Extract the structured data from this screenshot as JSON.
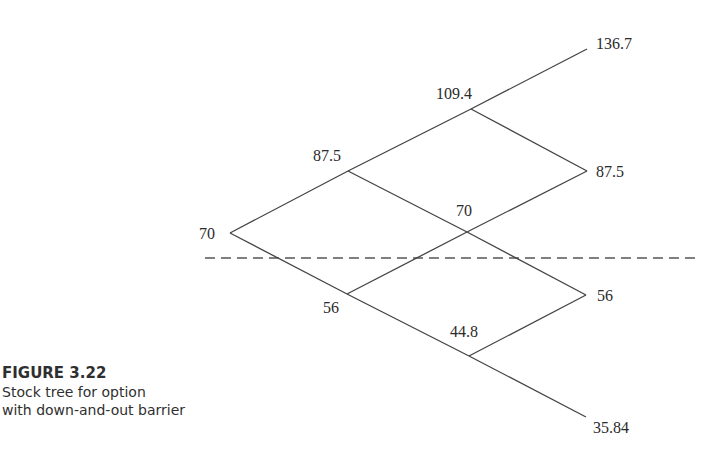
{
  "figure": {
    "title": "FIGURE 3.22",
    "caption_lines": [
      "Stock tree for option",
      "with down-and-out barrier"
    ]
  },
  "tree": {
    "line_color": "#444444",
    "barrier": {
      "y": 258,
      "x1": 205,
      "x2": 698,
      "style": "dashed"
    },
    "nodes": [
      {
        "id": "n0",
        "value": "70",
        "x": 230,
        "y": 233,
        "label_x": 199,
        "label_y": 226
      },
      {
        "id": "u1",
        "value": "87.5",
        "x": 348,
        "y": 171,
        "label_x": 313,
        "label_y": 148
      },
      {
        "id": "d1",
        "value": "56",
        "x": 347,
        "y": 294,
        "label_x": 323,
        "label_y": 300
      },
      {
        "id": "uu2",
        "value": "109.4",
        "x": 471,
        "y": 109,
        "label_x": 436,
        "label_y": 86
      },
      {
        "id": "ud2",
        "value": "70",
        "x": 467,
        "y": 232,
        "label_x": 456,
        "label_y": 203
      },
      {
        "id": "dd2",
        "value": "44.8",
        "x": 469,
        "y": 356,
        "label_x": 450,
        "label_y": 324
      },
      {
        "id": "uuu3",
        "value": "136.7",
        "x": 587,
        "y": 49,
        "label_x": 596,
        "label_y": 36
      },
      {
        "id": "uud3",
        "value": "87.5",
        "x": 587,
        "y": 171,
        "label_x": 596,
        "label_y": 164
      },
      {
        "id": "udd3",
        "value": "56",
        "x": 586,
        "y": 295,
        "label_x": 597,
        "label_y": 288
      },
      {
        "id": "ddd3",
        "value": "35.84",
        "x": 586,
        "y": 417,
        "label_x": 593,
        "label_y": 420
      }
    ],
    "edges": [
      [
        "n0",
        "u1"
      ],
      [
        "n0",
        "d1"
      ],
      [
        "u1",
        "uu2"
      ],
      [
        "u1",
        "ud2"
      ],
      [
        "d1",
        "ud2"
      ],
      [
        "d1",
        "dd2"
      ],
      [
        "uu2",
        "uuu3"
      ],
      [
        "uu2",
        "uud3"
      ],
      [
        "ud2",
        "uud3"
      ],
      [
        "ud2",
        "udd3"
      ],
      [
        "dd2",
        "udd3"
      ],
      [
        "dd2",
        "ddd3"
      ]
    ]
  }
}
